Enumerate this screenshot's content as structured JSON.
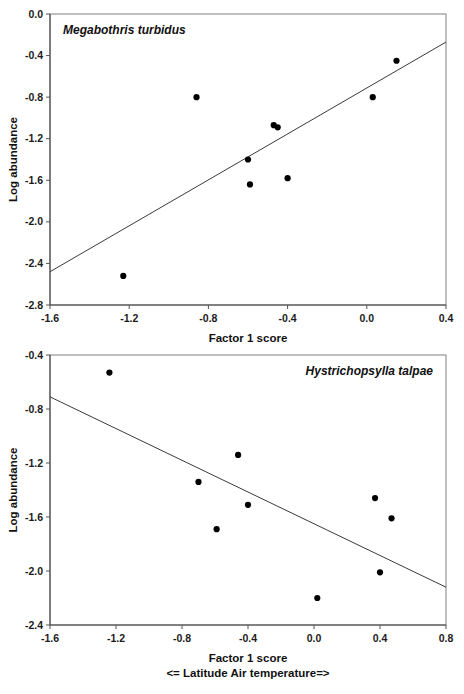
{
  "figure": {
    "background": "#ffffff",
    "point_color": "#000000",
    "line_color": "#3a3a3a",
    "frame_color": "#8a8a8a"
  },
  "chart_data": [
    {
      "type": "scatter",
      "title": "Megabothris turbidus",
      "xlabel": "Factor 1 score",
      "xlabel_sub": "<= Latitude  Air temperature=>",
      "ylabel": "Log abundance",
      "xlim": [
        -1.6,
        0.4
      ],
      "ylim": [
        -2.8,
        0.0
      ],
      "xticks": [
        -1.6,
        -1.2,
        -0.8,
        -0.4,
        0.0,
        0.4
      ],
      "xtick_labels": [
        "-1.6",
        "-1.2",
        "-0.8",
        "-0.4",
        "0.0",
        "0.4"
      ],
      "yticks": [
        0.0,
        -0.4,
        -0.8,
        -1.2,
        -1.6,
        -2.0,
        -2.4,
        -2.8
      ],
      "ytick_labels": [
        "0.0",
        "-0.4",
        "-0.8",
        "-1.2",
        "-1.6",
        "-2.0",
        "-2.4",
        "-2.8"
      ],
      "grid": false,
      "legend": "none",
      "points": [
        {
          "x": -1.23,
          "y": -2.52
        },
        {
          "x": -0.86,
          "y": -0.8
        },
        {
          "x": -0.6,
          "y": -1.4
        },
        {
          "x": -0.59,
          "y": -1.64
        },
        {
          "x": -0.47,
          "y": -1.07
        },
        {
          "x": -0.45,
          "y": -1.09
        },
        {
          "x": -0.4,
          "y": -1.58
        },
        {
          "x": 0.03,
          "y": -0.8
        },
        {
          "x": 0.15,
          "y": -0.45
        }
      ],
      "trendline": {
        "x0": -1.6,
        "y0": -2.48,
        "x1": 0.4,
        "y1": -0.27,
        "direction": "positive"
      }
    },
    {
      "type": "scatter",
      "title": "Hystrichopsylla talpae",
      "xlabel": "Factor 1 score",
      "xlabel_sub": "<= Latitude  Air temperature=>",
      "ylabel": "Log abundance",
      "xlim": [
        -1.6,
        0.8
      ],
      "ylim": [
        -2.4,
        -0.4
      ],
      "xticks": [
        -1.6,
        -1.2,
        -0.8,
        -0.4,
        0.0,
        0.4,
        0.8
      ],
      "xtick_labels": [
        "-1.6",
        "-1.2",
        "-0.8",
        "-0.4",
        "0.0",
        "0.4",
        "0.8"
      ],
      "yticks": [
        -0.4,
        -0.8,
        -1.2,
        -1.6,
        -2.0,
        -2.4
      ],
      "ytick_labels": [
        "-0.4",
        "-0.8",
        "-1.2",
        "-1.6",
        "-2.0",
        "-2.4"
      ],
      "grid": false,
      "legend": "none",
      "points": [
        {
          "x": -1.24,
          "y": -0.53
        },
        {
          "x": -0.7,
          "y": -1.34
        },
        {
          "x": -0.59,
          "y": -1.69
        },
        {
          "x": -0.46,
          "y": -1.14
        },
        {
          "x": -0.4,
          "y": -1.51
        },
        {
          "x": 0.02,
          "y": -2.2
        },
        {
          "x": 0.37,
          "y": -1.46
        },
        {
          "x": 0.4,
          "y": -2.01
        },
        {
          "x": 0.47,
          "y": -1.61
        }
      ],
      "trendline": {
        "x0": -1.6,
        "y0": -0.71,
        "x1": 0.8,
        "y1": -2.12,
        "direction": "negative"
      }
    }
  ]
}
